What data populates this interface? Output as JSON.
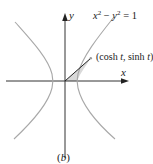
{
  "figure": {
    "caption": "(b)",
    "equation": "x² − y² = 1",
    "equation_parts": {
      "x": "x",
      "sup1": "2",
      "minus": " − ",
      "y": "y",
      "sup2": "2",
      "eq": " = 1"
    },
    "point_label": "(cosh t, sinh t)",
    "point_parts": {
      "open": "(cosh ",
      "t1": "t",
      "comma": ", sinh ",
      "t2": "t",
      "close": ")"
    },
    "x_axis_label": "x",
    "y_axis_label": "y",
    "colors": {
      "axes": "#333333",
      "curve": "#a8a8a8",
      "shade": "#d6d6d6",
      "radius": "#222222"
    }
  }
}
